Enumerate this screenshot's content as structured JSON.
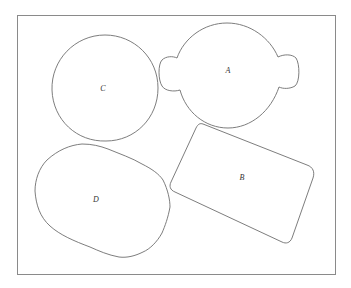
{
  "figure": {
    "frame": {
      "x": 17,
      "y": 15,
      "width": 318,
      "height": 259
    },
    "shapes": [
      {
        "id": "A",
        "label": "A",
        "kind": "round-body-with-side-tabs",
        "label_pos": [
          228,
          73
        ]
      },
      {
        "id": "B",
        "label": "B",
        "kind": "rounded-rectangle-tilted",
        "label_pos": [
          242,
          180
        ]
      },
      {
        "id": "C",
        "label": "C",
        "kind": "circle",
        "label_pos": [
          103,
          91
        ]
      },
      {
        "id": "D",
        "label": "D",
        "kind": "irregular-oval",
        "label_pos": [
          96,
          202
        ]
      }
    ],
    "colors": {
      "background": "#ffffff",
      "frame_stroke": "#8a8a8a",
      "shape_stroke": "#6e6e6e",
      "label_text": "#333333"
    }
  }
}
